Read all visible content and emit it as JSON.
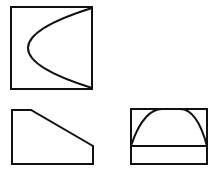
{
  "diagram": {
    "type": "orthographic-projection",
    "stroke_color": "#111111",
    "background_color": "#ffffff",
    "views": [
      {
        "id": "top-view",
        "description": "square with parabolic curve opening to the right",
        "outline": {
          "x": 11,
          "y": 7,
          "width": 81,
          "height": 82
        },
        "curve": {
          "start": [
            92,
            8
          ],
          "vertex": [
            28,
            48
          ],
          "end": [
            92,
            88
          ]
        }
      },
      {
        "id": "front-view",
        "description": "pentagon / truncated trapezoid with sloped top edge",
        "points": [
          [
            12,
            110
          ],
          [
            31,
            110
          ],
          [
            93,
            146
          ],
          [
            93,
            164
          ],
          [
            12,
            164
          ]
        ]
      },
      {
        "id": "side-view",
        "description": "rectangle with horizontal line and parabolic arch",
        "outline": {
          "x": 131,
          "y": 109,
          "width": 76,
          "height": 55
        },
        "divider_y": 146,
        "arch": {
          "start": [
            131,
            146
          ],
          "top_left": [
            160,
            109
          ],
          "top_right": [
            181,
            109
          ],
          "end": [
            207,
            146
          ]
        }
      }
    ]
  }
}
